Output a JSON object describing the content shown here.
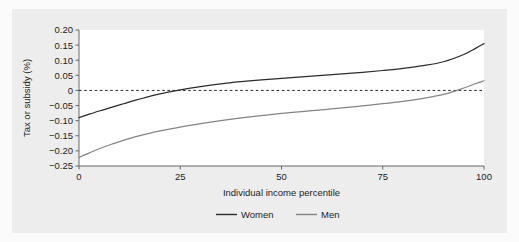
{
  "figure": {
    "background_color": "#fbfbfb",
    "panel_color": "#ededed",
    "plot_area_color": "#ffffff"
  },
  "chart_data": {
    "type": "line",
    "title": "",
    "subtitle": "",
    "xlabel": "Individual income percentile",
    "ylabel": "Tax or subsidy (%)",
    "xlim": [
      0,
      100
    ],
    "ylim": [
      -0.25,
      0.2
    ],
    "xticks": [
      0,
      25,
      50,
      75,
      100
    ],
    "xtick_labels": [
      "0",
      "25",
      "50",
      "75",
      "100"
    ],
    "yticks": [
      0.2,
      0.15,
      0.1,
      0.05,
      0,
      -0.05,
      -0.1,
      -0.15,
      -0.2,
      -0.25
    ],
    "ytick_labels": [
      "0.20",
      "0.15",
      "0.10",
      "0.05",
      "0",
      "−0.05",
      "−0.10",
      "−0.15",
      "−0.20",
      "−0.25"
    ],
    "grid": false,
    "zero_reference_line": {
      "value": 0,
      "style": "dashed",
      "color": "#2b2b2b"
    },
    "legend": {
      "position": "bottom",
      "entries": [
        {
          "name": "Women",
          "color": "#2b2b2b"
        },
        {
          "name": "Men",
          "color": "#848484"
        }
      ]
    },
    "x": [
      0,
      2,
      5,
      8,
      11,
      14,
      17,
      20,
      25,
      30,
      35,
      40,
      45,
      50,
      55,
      60,
      65,
      70,
      75,
      80,
      85,
      90,
      95,
      98,
      100
    ],
    "series": [
      {
        "name": "Women",
        "color": "#2b2b2b",
        "values": [
          -0.09,
          -0.081,
          -0.068,
          -0.056,
          -0.044,
          -0.032,
          -0.021,
          -0.011,
          0.002,
          0.013,
          0.022,
          0.029,
          0.035,
          0.04,
          0.045,
          0.05,
          0.055,
          0.06,
          0.066,
          0.073,
          0.082,
          0.095,
          0.119,
          0.14,
          0.155
        ]
      },
      {
        "name": "Men",
        "color": "#848484",
        "values": [
          -0.222,
          -0.21,
          -0.193,
          -0.178,
          -0.165,
          -0.153,
          -0.143,
          -0.134,
          -0.121,
          -0.11,
          -0.1,
          -0.091,
          -0.083,
          -0.076,
          -0.07,
          -0.064,
          -0.058,
          -0.051,
          -0.044,
          -0.036,
          -0.026,
          -0.013,
          0.008,
          0.023,
          0.032
        ]
      }
    ]
  }
}
